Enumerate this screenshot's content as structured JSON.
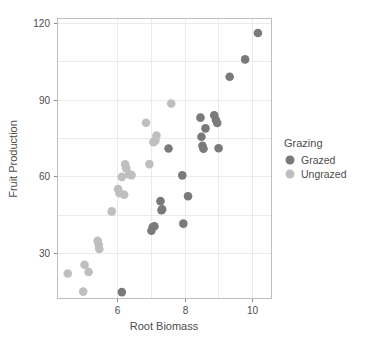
{
  "chart_data": {
    "type": "scatter",
    "title": "",
    "xlabel": "Root Biomass",
    "ylabel": "Fruit Production",
    "xlim": [
      4.2,
      10.6
    ],
    "ylim": [
      12,
      122
    ],
    "xticks": [
      6,
      8,
      10
    ],
    "yticks": [
      30,
      60,
      90,
      120
    ],
    "xtick_labels": [
      "6",
      "8",
      "10"
    ],
    "ytick_labels": [
      "30",
      "60",
      "90",
      "120"
    ],
    "grid": true,
    "grid_color": "#ebebeb",
    "panel_background": "#ffffff",
    "legend": {
      "title": "Grazing",
      "position": "right",
      "entries": [
        {
          "name": "Grazed",
          "color": "#7a7a7a"
        },
        {
          "name": "Ungrazed",
          "color": "#bfbfbf"
        }
      ]
    },
    "series": [
      {
        "name": "Grazed",
        "color": "#7a7a7a",
        "points": [
          [
            6.13,
            14.7
          ],
          [
            7.01,
            38.7
          ],
          [
            7.05,
            40.2
          ],
          [
            7.1,
            40.5
          ],
          [
            7.28,
            50.3
          ],
          [
            7.31,
            46.8
          ],
          [
            7.33,
            47.1
          ],
          [
            7.52,
            70.9
          ],
          [
            7.93,
            60.4
          ],
          [
            7.96,
            41.5
          ],
          [
            8.1,
            52.2
          ],
          [
            8.47,
            83.0
          ],
          [
            8.5,
            75.5
          ],
          [
            8.53,
            72.0
          ],
          [
            8.56,
            70.8
          ],
          [
            8.62,
            78.8
          ],
          [
            8.88,
            83.9
          ],
          [
            8.93,
            82.1
          ],
          [
            8.97,
            80.9
          ],
          [
            9.01,
            71.0
          ],
          [
            9.34,
            99.0
          ],
          [
            9.8,
            105.8
          ],
          [
            10.18,
            116.1
          ]
        ]
      },
      {
        "name": "Ungrazed",
        "color": "#bfbfbf",
        "points": [
          [
            4.52,
            22.0
          ],
          [
            4.98,
            14.9
          ],
          [
            5.02,
            25.4
          ],
          [
            5.14,
            22.6
          ],
          [
            5.41,
            34.8
          ],
          [
            5.44,
            33.3
          ],
          [
            5.46,
            31.6
          ],
          [
            5.83,
            46.3
          ],
          [
            6.02,
            55.0
          ],
          [
            6.06,
            53.4
          ],
          [
            6.13,
            59.8
          ],
          [
            6.2,
            52.8
          ],
          [
            6.23,
            64.7
          ],
          [
            6.26,
            63.2
          ],
          [
            6.35,
            60.8
          ],
          [
            6.42,
            60.5
          ],
          [
            6.85,
            81.0
          ],
          [
            6.95,
            64.8
          ],
          [
            7.07,
            73.4
          ],
          [
            7.13,
            74.0
          ],
          [
            7.16,
            76.0
          ],
          [
            7.6,
            88.5
          ]
        ]
      }
    ]
  }
}
